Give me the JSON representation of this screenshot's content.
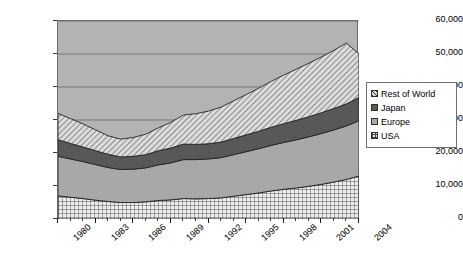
{
  "chart_data": {
    "type": "area",
    "stacked": true,
    "title": "",
    "xlabel": "",
    "ylabel": "",
    "xlim": [
      1980,
      2004
    ],
    "ylim": [
      0,
      60000
    ],
    "grid": true,
    "legend_position": "right",
    "x": [
      1980,
      1981,
      1982,
      1983,
      1984,
      1985,
      1986,
      1987,
      1988,
      1989,
      1990,
      1991,
      1992,
      1993,
      1994,
      1995,
      1996,
      1997,
      1998,
      1999,
      2000,
      2001,
      2002,
      2003,
      2004
    ],
    "y_ticks": [
      "0",
      "10,000",
      "20,000",
      "30,000",
      "40,000",
      "50,000",
      "60,000"
    ],
    "y_tick_values": [
      0,
      10000,
      20000,
      30000,
      40000,
      50000,
      60000
    ],
    "x_tick_labels": [
      "1980",
      "1983",
      "1986",
      "1989",
      "1992",
      "1995",
      "1998",
      "2001",
      "2004"
    ],
    "series": [
      {
        "name": "USA",
        "pattern": "grid",
        "values": [
          7000,
          6600,
          6200,
          5700,
          5300,
          5000,
          5000,
          5200,
          5600,
          5800,
          6200,
          6100,
          6200,
          6400,
          6900,
          7400,
          7900,
          8500,
          9000,
          9400,
          9900,
          10500,
          11200,
          12000,
          13000
        ]
      },
      {
        "name": "Europe",
        "pattern": "solid-gray",
        "values": [
          12000,
          11600,
          11200,
          10800,
          10300,
          10000,
          10100,
          10300,
          10800,
          11200,
          11800,
          11900,
          12000,
          12200,
          12600,
          13000,
          13400,
          13800,
          14200,
          14600,
          15000,
          15400,
          15800,
          16200,
          16800
        ]
      },
      {
        "name": "Japan",
        "pattern": "solid-dark",
        "values": [
          5000,
          4700,
          4400,
          4200,
          4000,
          3800,
          3900,
          4000,
          4300,
          4500,
          4700,
          4600,
          4600,
          4700,
          4900,
          5100,
          5300,
          5500,
          5700,
          5900,
          6100,
          6300,
          6500,
          6700,
          7000
        ]
      },
      {
        "name": "Rest of World",
        "pattern": "diagonal-hatch",
        "values": [
          8000,
          7500,
          7000,
          6300,
          5600,
          5400,
          5700,
          6200,
          6900,
          7800,
          8800,
          9300,
          9900,
          10600,
          11400,
          12200,
          13000,
          13900,
          14700,
          15500,
          16200,
          16900,
          17600,
          18400,
          13200
        ]
      }
    ],
    "totals": [
      32000,
      30400,
      28800,
      27000,
      25200,
      24200,
      24700,
      25700,
      27600,
      29300,
      31500,
      31900,
      32700,
      33900,
      35800,
      37700,
      39600,
      41700,
      43600,
      45400,
      47200,
      49100,
      51100,
      53300,
      50000
    ]
  },
  "legend": {
    "items": [
      {
        "label": "Rest of World",
        "swatch": "rest-of-world-swatch"
      },
      {
        "label": "Japan",
        "swatch": "japan-swatch"
      },
      {
        "label": "Europe",
        "swatch": "europe-swatch"
      },
      {
        "label": "USA",
        "swatch": "usa-swatch"
      }
    ]
  },
  "colors": {
    "plot_background": "#b3b3b3",
    "usa": "#e8e8e8",
    "europe": "#a8a8a8",
    "japan": "#585858",
    "rest_of_world": "#d7d7d7",
    "gridline": "#6a6a6a",
    "axis": "#3a3a3a"
  }
}
